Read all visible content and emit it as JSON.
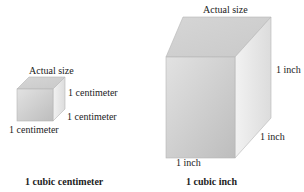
{
  "small_cube": {
    "top_label": "Actual size",
    "right_label": "1 centimeter",
    "depth_label": "1 centimeter",
    "bottom_label": "1 centimeter",
    "caption": "1 cubic centimeter"
  },
  "large_cube": {
    "top_label": "Actual size",
    "right_label": "1 inch",
    "depth_label": "1 inch",
    "bottom_label": "1 inch",
    "caption": "1 cubic inch"
  },
  "colors": {
    "front": "#c8c8c8",
    "top": "#dadada",
    "side": "#e4e4e4",
    "edge": "#b0b0b0"
  }
}
